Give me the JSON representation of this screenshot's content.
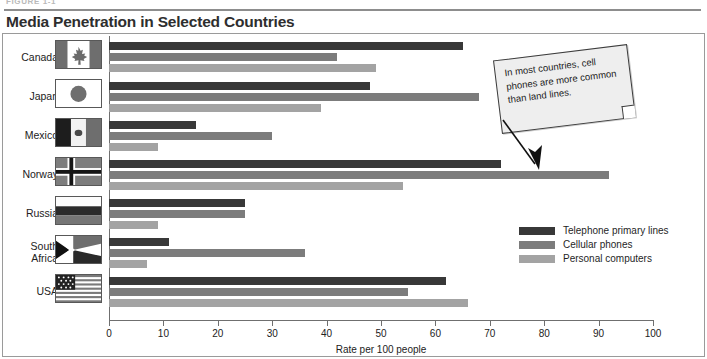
{
  "figure": {
    "label": "FIGURE 1-1",
    "title": "Media Penetration in Selected Countries"
  },
  "callout": {
    "text": "In most countries, cell phones are more common than land lines.",
    "arrow_icon": "down-arrow-icon"
  },
  "colors": {
    "series_1": "#383838",
    "series_2": "#7c7c7c",
    "series_3": "#a3a3a3",
    "axis": "#6f6f6f",
    "border": "#9a9a9a"
  },
  "chart_data": {
    "type": "bar",
    "orientation": "horizontal",
    "title": "Media Penetration in Selected Countries",
    "xlabel": "Rate per 100 people",
    "ylabel": "",
    "xlim": [
      0,
      100
    ],
    "xticks": [
      0,
      10,
      20,
      30,
      40,
      50,
      60,
      70,
      80,
      90,
      100
    ],
    "grid": false,
    "legend_position": "right-middle",
    "categories": [
      "Canada",
      "Japan",
      "Mexico",
      "Norway",
      "Russia",
      "South Africa",
      "USA"
    ],
    "series": [
      {
        "name": "Telephone primary lines",
        "color": "#383838",
        "values": [
          65,
          48,
          16,
          72,
          25,
          11,
          62
        ]
      },
      {
        "name": "Cellular phones",
        "color": "#7c7c7c",
        "values": [
          42,
          68,
          30,
          92,
          25,
          36,
          55
        ]
      },
      {
        "name": "Personal computers",
        "color": "#a3a3a3",
        "values": [
          49,
          39,
          9,
          54,
          9,
          7,
          66
        ]
      }
    ]
  },
  "flags": [
    {
      "country": "Canada",
      "icon": "flag-canada-icon"
    },
    {
      "country": "Japan",
      "icon": "flag-japan-icon"
    },
    {
      "country": "Mexico",
      "icon": "flag-mexico-icon"
    },
    {
      "country": "Norway",
      "icon": "flag-norway-icon"
    },
    {
      "country": "Russia",
      "icon": "flag-russia-icon"
    },
    {
      "country": "South Africa",
      "icon": "flag-south-africa-icon"
    },
    {
      "country": "USA",
      "icon": "flag-usa-icon"
    }
  ]
}
